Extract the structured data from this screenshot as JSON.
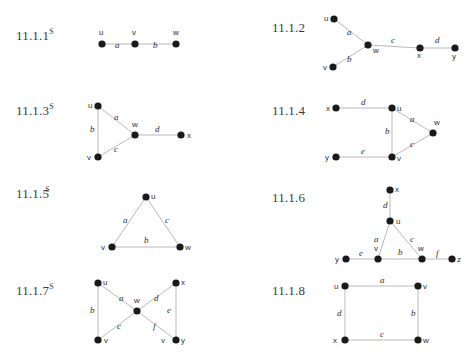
{
  "page": {
    "width": 470,
    "height": 356,
    "background": "#ffffff",
    "node_color": "#1a1a1a",
    "edge_color": "#b9b9b9",
    "text_color": "#2e2e2e",
    "label_color": "#3b3b3b"
  },
  "exercises": [
    {
      "id": "11-1-1",
      "number": "11.1.1",
      "superscript": "S",
      "label_x": 16,
      "label_y": 28,
      "graph": {
        "x": 88,
        "y": 22,
        "w": 100,
        "h": 34,
        "vertices": [
          {
            "name": "u",
            "cx": 14,
            "cy": 22,
            "lx": 11,
            "ly": 13
          },
          {
            "name": "v",
            "cx": 47,
            "cy": 22,
            "lx": 44,
            "ly": 13
          },
          {
            "name": "w",
            "cx": 88,
            "cy": 22,
            "lx": 85,
            "ly": 13
          }
        ],
        "edges": [
          {
            "name": "a",
            "x1": 14,
            "y1": 22,
            "x2": 47,
            "y2": 22,
            "lx": 27,
            "ly": 26
          },
          {
            "name": "b",
            "x1": 47,
            "y1": 22,
            "x2": 88,
            "y2": 22,
            "lx": 65,
            "ly": 26
          }
        ]
      }
    },
    {
      "id": "11-1-2",
      "number": "11.1.2",
      "superscript": "",
      "label_x": 272,
      "label_y": 20,
      "graph": {
        "x": 320,
        "y": 12,
        "w": 140,
        "h": 60,
        "vertices": [
          {
            "name": "u",
            "cx": 14,
            "cy": 7,
            "lx": 4,
            "ly": 9
          },
          {
            "name": "v",
            "cx": 13,
            "cy": 55,
            "lx": 3,
            "ly": 58
          },
          {
            "name": "w",
            "cx": 48,
            "cy": 33,
            "lx": 53,
            "ly": 41
          },
          {
            "name": "x",
            "cx": 100,
            "cy": 36,
            "lx": 97,
            "ly": 46
          },
          {
            "name": "y",
            "cx": 135,
            "cy": 36,
            "lx": 132,
            "ly": 47
          }
        ],
        "edges": [
          {
            "name": "a",
            "x1": 14,
            "y1": 7,
            "x2": 48,
            "y2": 33,
            "lx": 27,
            "ly": 23
          },
          {
            "name": "b",
            "x1": 13,
            "y1": 55,
            "x2": 48,
            "y2": 33,
            "lx": 27,
            "ly": 50
          },
          {
            "name": "c",
            "x1": 48,
            "y1": 33,
            "x2": 100,
            "y2": 36,
            "lx": 71,
            "ly": 31
          },
          {
            "name": "d",
            "x1": 100,
            "y1": 36,
            "x2": 135,
            "y2": 36,
            "lx": 115,
            "ly": 31
          }
        ]
      }
    },
    {
      "id": "11-1-3",
      "number": "11.1.3",
      "superscript": "S",
      "label_x": 16,
      "label_y": 103,
      "graph": {
        "x": 84,
        "y": 100,
        "w": 105,
        "h": 62,
        "vertices": [
          {
            "name": "u",
            "cx": 14,
            "cy": 6,
            "lx": 4,
            "ly": 8
          },
          {
            "name": "v",
            "cx": 14,
            "cy": 57,
            "lx": 3,
            "ly": 60
          },
          {
            "name": "w",
            "cx": 51,
            "cy": 35,
            "lx": 48,
            "ly": 27
          },
          {
            "name": "x",
            "cx": 97,
            "cy": 35,
            "lx": 103,
            "ly": 38
          }
        ],
        "edges": [
          {
            "name": "a",
            "x1": 14,
            "y1": 6,
            "x2": 51,
            "y2": 35,
            "lx": 30,
            "ly": 20
          },
          {
            "name": "b",
            "x1": 14,
            "y1": 6,
            "x2": 14,
            "y2": 57,
            "lx": 6,
            "ly": 32
          },
          {
            "name": "c",
            "x1": 14,
            "y1": 57,
            "x2": 51,
            "y2": 35,
            "lx": 30,
            "ly": 52
          },
          {
            "name": "d",
            "x1": 51,
            "y1": 35,
            "x2": 97,
            "y2": 35,
            "lx": 71,
            "ly": 32
          }
        ]
      }
    },
    {
      "id": "11-1-4",
      "number": "11.1.4",
      "superscript": "",
      "label_x": 272,
      "label_y": 103,
      "graph": {
        "x": 330,
        "y": 100,
        "w": 115,
        "h": 62,
        "vertices": [
          {
            "name": "x",
            "cx": 6,
            "cy": 8,
            "lx": -4,
            "ly": 11
          },
          {
            "name": "u",
            "cx": 62,
            "cy": 8,
            "lx": 67,
            "ly": 11
          },
          {
            "name": "w",
            "cx": 103,
            "cy": 33,
            "lx": 104,
            "ly": 25
          },
          {
            "name": "v",
            "cx": 62,
            "cy": 57,
            "lx": 67,
            "ly": 61
          },
          {
            "name": "y",
            "cx": 6,
            "cy": 57,
            "lx": -5,
            "ly": 60
          }
        ],
        "edges": [
          {
            "name": "d",
            "x1": 6,
            "y1": 8,
            "x2": 62,
            "y2": 8,
            "lx": 31,
            "ly": 5
          },
          {
            "name": "a",
            "x1": 62,
            "y1": 8,
            "x2": 103,
            "y2": 33,
            "lx": 80,
            "ly": 22
          },
          {
            "name": "b",
            "x1": 62,
            "y1": 8,
            "x2": 62,
            "y2": 57,
            "lx": 55,
            "ly": 34
          },
          {
            "name": "c",
            "x1": 103,
            "y1": 33,
            "x2": 62,
            "y2": 57,
            "lx": 80,
            "ly": 47
          },
          {
            "name": "e",
            "x1": 6,
            "y1": 57,
            "x2": 62,
            "y2": 57,
            "lx": 31,
            "ly": 54
          }
        ]
      }
    },
    {
      "id": "11-1-5",
      "number": "11.1.5",
      "superscript": "S",
      "label_x": 16,
      "label_y": 186,
      "tight": true,
      "graph": {
        "x": 106,
        "y": 190,
        "w": 80,
        "h": 60,
        "vertices": [
          {
            "name": "u",
            "cx": 40,
            "cy": 7,
            "lx": 45,
            "ly": 9
          },
          {
            "name": "v",
            "cx": 6,
            "cy": 57,
            "lx": -5,
            "ly": 60
          },
          {
            "name": "w",
            "cx": 74,
            "cy": 57,
            "lx": 79,
            "ly": 60
          }
        ],
        "edges": [
          {
            "name": "a",
            "x1": 40,
            "y1": 7,
            "x2": 6,
            "y2": 57,
            "lx": 17,
            "ly": 33
          },
          {
            "name": "c",
            "x1": 40,
            "y1": 7,
            "x2": 74,
            "y2": 57,
            "lx": 59,
            "ly": 33
          },
          {
            "name": "b",
            "x1": 6,
            "y1": 57,
            "x2": 74,
            "y2": 57,
            "lx": 38,
            "ly": 53
          }
        ]
      }
    },
    {
      "id": "11-1-6",
      "number": "11.1.6",
      "superscript": "",
      "label_x": 272,
      "label_y": 190,
      "graph": {
        "x": 330,
        "y": 186,
        "w": 130,
        "h": 78,
        "vertices": [
          {
            "name": "x",
            "cx": 60,
            "cy": 4,
            "lx": 65,
            "ly": 6
          },
          {
            "name": "u",
            "cx": 60,
            "cy": 35,
            "lx": 66,
            "ly": 38
          },
          {
            "name": "v",
            "cx": 48,
            "cy": 73,
            "lx": 44,
            "ly": 65
          },
          {
            "name": "w",
            "cx": 92,
            "cy": 73,
            "lx": 88,
            "ly": 65
          },
          {
            "name": "y",
            "cx": 16,
            "cy": 73,
            "lx": 5,
            "ly": 76
          },
          {
            "name": "z",
            "cx": 122,
            "cy": 73,
            "lx": 127,
            "ly": 76
          }
        ],
        "edges": [
          {
            "name": "d",
            "x1": 60,
            "y1": 4,
            "x2": 60,
            "y2": 35,
            "lx": 53,
            "ly": 22
          },
          {
            "name": "a",
            "x1": 60,
            "y1": 35,
            "x2": 48,
            "y2": 73,
            "lx": 44,
            "ly": 56
          },
          {
            "name": "c",
            "x1": 60,
            "y1": 35,
            "x2": 92,
            "y2": 73,
            "lx": 80,
            "ly": 56
          },
          {
            "name": "b",
            "x1": 48,
            "y1": 73,
            "x2": 92,
            "y2": 73,
            "lx": 68,
            "ly": 69
          },
          {
            "name": "e",
            "x1": 16,
            "y1": 73,
            "x2": 48,
            "y2": 73,
            "lx": 29,
            "ly": 70
          },
          {
            "name": "f",
            "x1": 92,
            "y1": 73,
            "x2": 122,
            "y2": 73,
            "lx": 106,
            "ly": 70
          }
        ]
      }
    },
    {
      "id": "11-1-7",
      "number": "11.1.7",
      "superscript": "S",
      "label_x": 16,
      "label_y": 283,
      "graph": {
        "x": 88,
        "y": 278,
        "w": 105,
        "h": 66,
        "vertices": [
          {
            "name": "u",
            "cx": 10,
            "cy": 5,
            "lx": 15,
            "ly": 7
          },
          {
            "name": "x",
            "cx": 88,
            "cy": 5,
            "lx": 93,
            "ly": 7
          },
          {
            "name": "w",
            "cx": 49,
            "cy": 33,
            "lx": 46,
            "ly": 25
          },
          {
            "name": "v",
            "cx": 10,
            "cy": 62,
            "lx": 16,
            "ly": 65
          },
          {
            "name": "y",
            "cx": 88,
            "cy": 62,
            "lx": 93,
            "ly": 65
          }
        ],
        "edges": [
          {
            "name": "a",
            "x1": 10,
            "y1": 5,
            "x2": 49,
            "y2": 33,
            "lx": 31,
            "ly": 23
          },
          {
            "name": "d",
            "x1": 88,
            "y1": 5,
            "x2": 49,
            "y2": 33,
            "lx": 66,
            "ly": 23
          },
          {
            "name": "b",
            "x1": 10,
            "y1": 5,
            "x2": 10,
            "y2": 62,
            "lx": 2,
            "ly": 35
          },
          {
            "name": "e",
            "x1": 88,
            "y1": 5,
            "x2": 88,
            "y2": 62,
            "lx": 79,
            "ly": 35
          },
          {
            "name": "c",
            "x1": 10,
            "y1": 62,
            "x2": 49,
            "y2": 33,
            "lx": 29,
            "ly": 51
          },
          {
            "name": "f",
            "x1": 88,
            "y1": 62,
            "x2": 49,
            "y2": 33,
            "lx": 65,
            "ly": 51
          }
        ],
        "extra_labels": [
          {
            "name": "v",
            "text": "v",
            "lx": 73,
            "ly": 65
          }
        ]
      }
    },
    {
      "id": "11-1-8",
      "number": "11.1.8",
      "superscript": "",
      "label_x": 272,
      "label_y": 283,
      "graph": {
        "x": 330,
        "y": 280,
        "w": 100,
        "h": 62,
        "vertices": [
          {
            "name": "u",
            "cx": 15,
            "cy": 6,
            "lx": 4,
            "ly": 9
          },
          {
            "name": "v",
            "cx": 88,
            "cy": 6,
            "lx": 93,
            "ly": 9
          },
          {
            "name": "w",
            "cx": 88,
            "cy": 60,
            "lx": 93,
            "ly": 63
          },
          {
            "name": "x",
            "cx": 15,
            "cy": 60,
            "lx": 3,
            "ly": 63
          }
        ],
        "edges": [
          {
            "name": "a",
            "x1": 15,
            "y1": 6,
            "x2": 88,
            "y2": 6,
            "lx": 50,
            "ly": 3
          },
          {
            "name": "b",
            "x1": 88,
            "y1": 6,
            "x2": 88,
            "y2": 60,
            "lx": 81,
            "ly": 36
          },
          {
            "name": "c",
            "x1": 15,
            "y1": 60,
            "x2": 88,
            "y2": 60,
            "lx": 50,
            "ly": 57
          },
          {
            "name": "d",
            "x1": 15,
            "y1": 6,
            "x2": 15,
            "y2": 60,
            "lx": 7,
            "ly": 36
          }
        ]
      }
    }
  ]
}
